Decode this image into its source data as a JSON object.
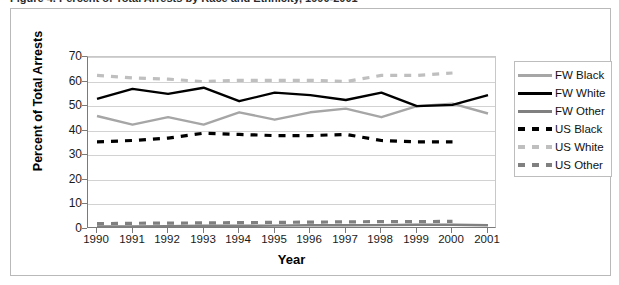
{
  "figure": {
    "caption": "Figure 4. Percent of Total Arrests by Race and Ethnicity, 1990-2001"
  },
  "chart_data": {
    "type": "line",
    "title": "",
    "xlabel": "Year",
    "ylabel": "Percent of Total Arrests",
    "categories": [
      "1990",
      "1991",
      "1992",
      "1993",
      "1994",
      "1995",
      "1996",
      "1997",
      "1998",
      "1999",
      "2000",
      "2001"
    ],
    "x": [
      1990,
      1991,
      1992,
      1993,
      1994,
      1995,
      1996,
      1997,
      1998,
      1999,
      2000,
      2001
    ],
    "xlim": [
      1990,
      2001
    ],
    "ylim": [
      0,
      70
    ],
    "yticks": [
      0,
      10,
      20,
      30,
      40,
      50,
      60,
      70
    ],
    "grid": true,
    "legend_position": "right",
    "series": [
      {
        "name": "FW Black",
        "color": "#a6a6a6",
        "style": "solid",
        "values": [
          46.0,
          42.5,
          45.5,
          42.5,
          47.5,
          44.5,
          47.5,
          49.0,
          45.5,
          50.0,
          51.0,
          47.0
        ]
      },
      {
        "name": "FW White",
        "color": "#000000",
        "style": "solid",
        "values": [
          53.0,
          57.0,
          55.0,
          57.5,
          52.0,
          55.5,
          54.5,
          52.5,
          55.5,
          50.0,
          50.5,
          54.5
        ]
      },
      {
        "name": "FW Other",
        "color": "#808080",
        "style": "solid",
        "values": [
          1.0,
          1.0,
          1.2,
          1.3,
          1.3,
          1.4,
          1.5,
          1.5,
          1.6,
          1.7,
          1.7,
          1.5
        ]
      },
      {
        "name": "US Black",
        "color": "#000000",
        "style": "dashed",
        "values": [
          35.5,
          36.0,
          37.0,
          39.0,
          38.5,
          38.0,
          38.0,
          38.5,
          36.0,
          35.5,
          35.5,
          null
        ]
      },
      {
        "name": "US White",
        "color": "#bfbfbf",
        "style": "dashed",
        "values": [
          62.5,
          61.5,
          61.0,
          60.0,
          60.5,
          60.5,
          60.5,
          60.0,
          62.5,
          62.5,
          63.5,
          null
        ]
      },
      {
        "name": "US Other",
        "color": "#808080",
        "style": "dashed",
        "values": [
          2.2,
          2.3,
          2.4,
          2.5,
          2.6,
          2.7,
          2.8,
          2.9,
          3.0,
          3.0,
          3.1,
          null
        ]
      }
    ]
  },
  "legend": {
    "items": [
      {
        "label": "FW Black"
      },
      {
        "label": "FW White"
      },
      {
        "label": "FW Other"
      },
      {
        "label": "US Black"
      },
      {
        "label": "US White"
      },
      {
        "label": "US Other"
      }
    ]
  }
}
